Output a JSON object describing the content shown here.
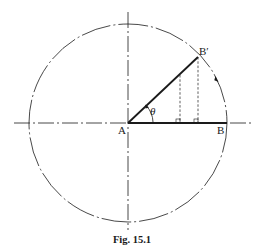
{
  "figure": {
    "caption": "Fig. 15.1",
    "labels": {
      "center": "A",
      "radius_end": "B",
      "rotated_end": "B′",
      "angle": "θ"
    }
  },
  "geometry": {
    "center": [
      128,
      123
    ],
    "radius": 99,
    "angle_deg": 50,
    "projection_dashed_x": [
      180,
      198
    ]
  },
  "colors": {
    "ink": "#1a1a1a",
    "background": "#ffffff"
  }
}
